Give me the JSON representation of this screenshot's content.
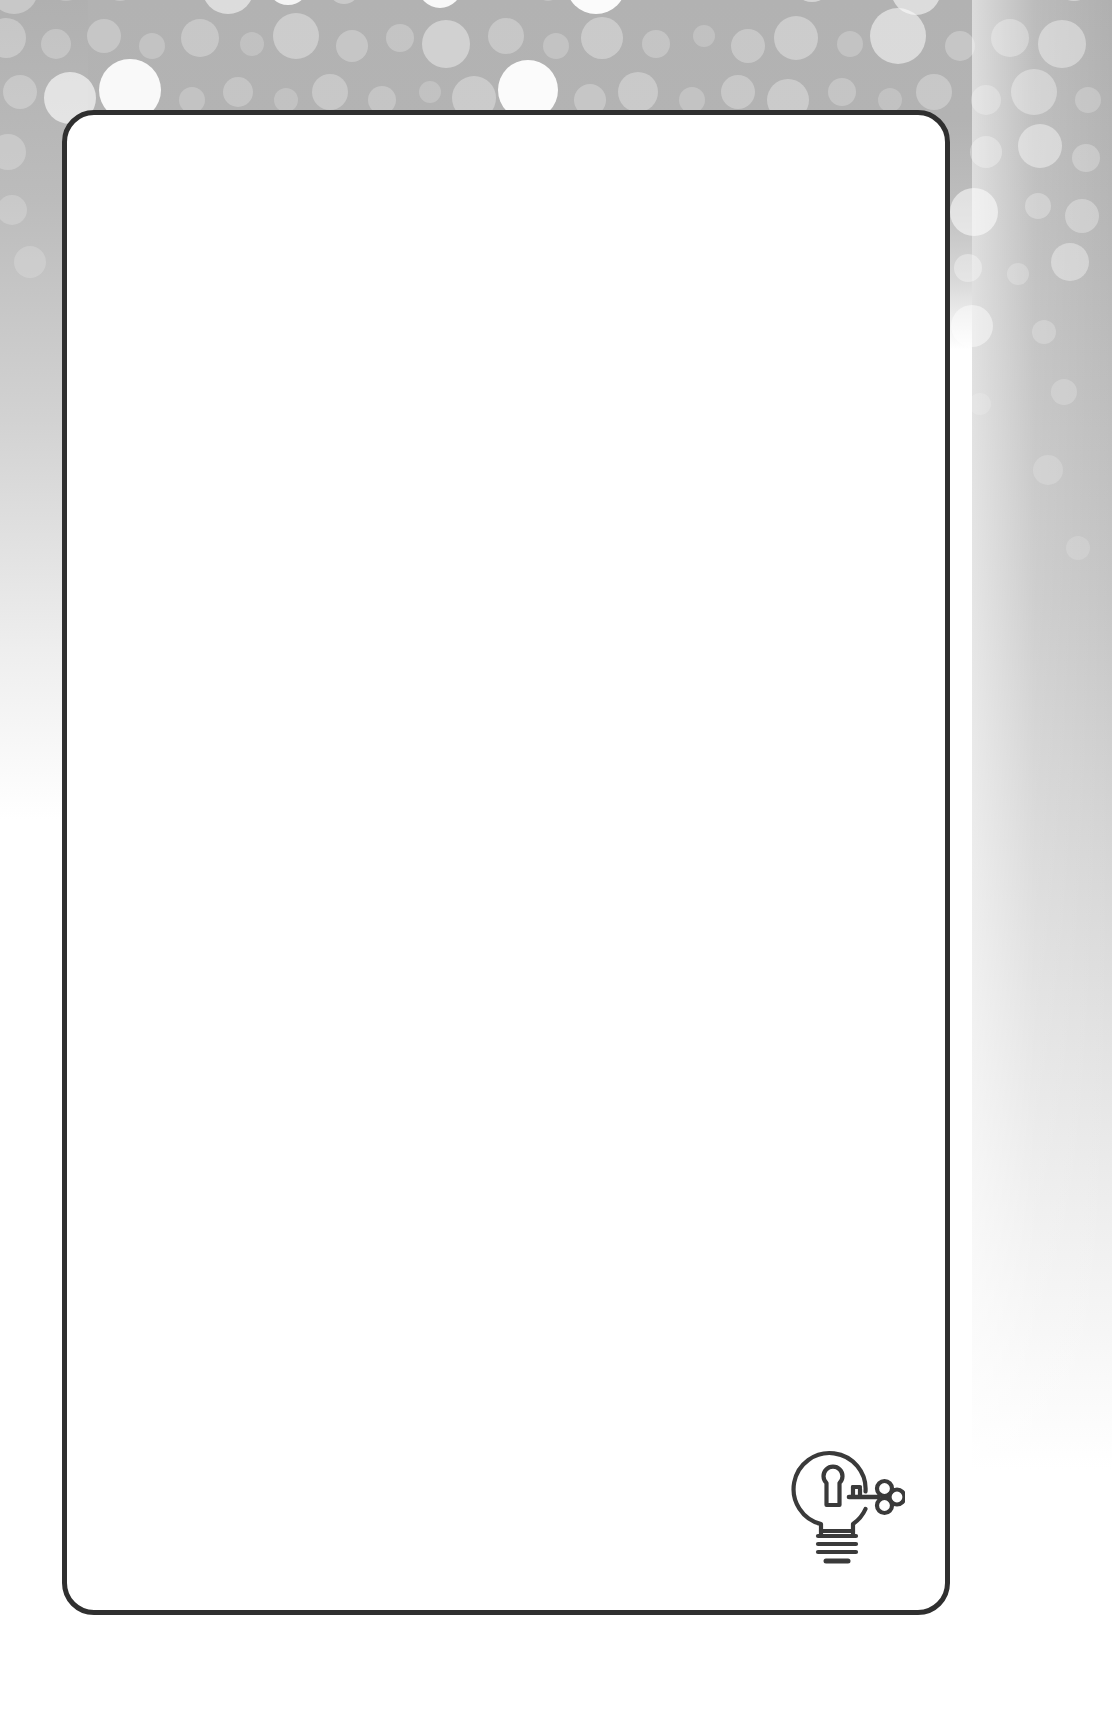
{
  "document": {
    "kind": "blank-certificate-template",
    "title": "",
    "body_text": "",
    "background_style": "bokeh-dots-grey-gradient"
  },
  "card": {
    "border_color": "#2f2f2f",
    "background_color": "#ffffff",
    "border_radius_px": 32,
    "border_width_px": 5,
    "content": ""
  },
  "logo": {
    "name": "lightbulb-keyhole-key-icon",
    "description": "Light bulb outline containing a keyhole with a key inserted from the right",
    "stroke_color": "#3a3a3a",
    "caption": ""
  },
  "background": {
    "band_color_top": "#b2b2b2",
    "band_color_left": "#b0b0b0",
    "band_color_right": "#b0b0b0",
    "dot_color": "#ffffff",
    "page_color": "#ffffff"
  },
  "decor_dots": [
    {
      "x": 14,
      "y": -10,
      "r": 24,
      "o": 0.3
    },
    {
      "x": 66,
      "y": -18,
      "r": 19,
      "o": 0.22
    },
    {
      "x": 120,
      "y": -14,
      "r": 15,
      "o": 0.25
    },
    {
      "x": 176,
      "y": -20,
      "r": 12,
      "o": 0.2
    },
    {
      "x": 228,
      "y": -12,
      "r": 26,
      "o": 0.55
    },
    {
      "x": 288,
      "y": -16,
      "r": 21,
      "o": 0.85
    },
    {
      "x": 344,
      "y": -12,
      "r": 16,
      "o": 0.3
    },
    {
      "x": 392,
      "y": -18,
      "r": 13,
      "o": 0.25
    },
    {
      "x": 440,
      "y": -14,
      "r": 22,
      "o": 0.9
    },
    {
      "x": 500,
      "y": -20,
      "r": 14,
      "o": 0.3
    },
    {
      "x": 548,
      "y": -10,
      "r": 11,
      "o": 0.22
    },
    {
      "x": 596,
      "y": -16,
      "r": 30,
      "o": 0.95
    },
    {
      "x": 660,
      "y": -14,
      "r": 13,
      "o": 0.25
    },
    {
      "x": 710,
      "y": -20,
      "r": 16,
      "o": 0.3
    },
    {
      "x": 764,
      "y": -12,
      "r": 12,
      "o": 0.22
    },
    {
      "x": 812,
      "y": -18,
      "r": 20,
      "o": 0.45
    },
    {
      "x": 866,
      "y": -14,
      "r": 14,
      "o": 0.25
    },
    {
      "x": 916,
      "y": -10,
      "r": 25,
      "o": 0.55
    },
    {
      "x": 974,
      "y": -18,
      "r": 18,
      "o": 0.3
    },
    {
      "x": 1026,
      "y": -14,
      "r": 13,
      "o": 0.25
    },
    {
      "x": 1074,
      "y": -20,
      "r": 21,
      "o": 0.4
    },
    {
      "x": 6,
      "y": 38,
      "r": 20,
      "o": 0.28
    },
    {
      "x": 56,
      "y": 44,
      "r": 15,
      "o": 0.24
    },
    {
      "x": 104,
      "y": 36,
      "r": 17,
      "o": 0.26
    },
    {
      "x": 152,
      "y": 46,
      "r": 13,
      "o": 0.22
    },
    {
      "x": 200,
      "y": 38,
      "r": 19,
      "o": 0.28
    },
    {
      "x": 252,
      "y": 44,
      "r": 12,
      "o": 0.2
    },
    {
      "x": 296,
      "y": 36,
      "r": 23,
      "o": 0.34
    },
    {
      "x": 352,
      "y": 46,
      "r": 16,
      "o": 0.26
    },
    {
      "x": 400,
      "y": 38,
      "r": 14,
      "o": 0.24
    },
    {
      "x": 446,
      "y": 44,
      "r": 24,
      "o": 0.4
    },
    {
      "x": 506,
      "y": 36,
      "r": 18,
      "o": 0.28
    },
    {
      "x": 556,
      "y": 46,
      "r": 13,
      "o": 0.22
    },
    {
      "x": 602,
      "y": 38,
      "r": 21,
      "o": 0.32
    },
    {
      "x": 656,
      "y": 44,
      "r": 14,
      "o": 0.24
    },
    {
      "x": 704,
      "y": 36,
      "r": 11,
      "o": 0.2
    },
    {
      "x": 748,
      "y": 46,
      "r": 17,
      "o": 0.28
    },
    {
      "x": 796,
      "y": 38,
      "r": 22,
      "o": 0.34
    },
    {
      "x": 850,
      "y": 44,
      "r": 13,
      "o": 0.22
    },
    {
      "x": 898,
      "y": 36,
      "r": 28,
      "o": 0.52
    },
    {
      "x": 960,
      "y": 46,
      "r": 15,
      "o": 0.26
    },
    {
      "x": 1010,
      "y": 38,
      "r": 19,
      "o": 0.3
    },
    {
      "x": 1062,
      "y": 44,
      "r": 24,
      "o": 0.38
    },
    {
      "x": 20,
      "y": 92,
      "r": 17,
      "o": 0.26
    },
    {
      "x": 70,
      "y": 98,
      "r": 26,
      "o": 0.62
    },
    {
      "x": 130,
      "y": 90,
      "r": 31,
      "o": 0.92
    },
    {
      "x": 192,
      "y": 100,
      "r": 13,
      "o": 0.22
    },
    {
      "x": 238,
      "y": 92,
      "r": 15,
      "o": 0.24
    },
    {
      "x": 286,
      "y": 100,
      "r": 12,
      "o": 0.2
    },
    {
      "x": 330,
      "y": 92,
      "r": 18,
      "o": 0.28
    },
    {
      "x": 382,
      "y": 100,
      "r": 14,
      "o": 0.24
    },
    {
      "x": 430,
      "y": 92,
      "r": 11,
      "o": 0.2
    },
    {
      "x": 474,
      "y": 98,
      "r": 22,
      "o": 0.32
    },
    {
      "x": 528,
      "y": 90,
      "r": 30,
      "o": 0.95
    },
    {
      "x": 590,
      "y": 100,
      "r": 16,
      "o": 0.26
    },
    {
      "x": 638,
      "y": 92,
      "r": 20,
      "o": 0.3
    },
    {
      "x": 692,
      "y": 100,
      "r": 13,
      "o": 0.22
    },
    {
      "x": 738,
      "y": 92,
      "r": 17,
      "o": 0.28
    },
    {
      "x": 788,
      "y": 100,
      "r": 21,
      "o": 0.32
    },
    {
      "x": 842,
      "y": 92,
      "r": 14,
      "o": 0.24
    },
    {
      "x": 890,
      "y": 100,
      "r": 12,
      "o": 0.2
    },
    {
      "x": 934,
      "y": 92,
      "r": 18,
      "o": 0.28
    },
    {
      "x": 986,
      "y": 100,
      "r": 15,
      "o": 0.26
    },
    {
      "x": 1034,
      "y": 92,
      "r": 23,
      "o": 0.34
    },
    {
      "x": 1088,
      "y": 100,
      "r": 13,
      "o": 0.22
    },
    {
      "x": 8,
      "y": 152,
      "r": 18,
      "o": 0.24
    },
    {
      "x": 986,
      "y": 152,
      "r": 16,
      "o": 0.3
    },
    {
      "x": 1040,
      "y": 146,
      "r": 22,
      "o": 0.42
    },
    {
      "x": 1086,
      "y": 158,
      "r": 14,
      "o": 0.26
    },
    {
      "x": 12,
      "y": 210,
      "r": 15,
      "o": 0.2
    },
    {
      "x": 974,
      "y": 212,
      "r": 24,
      "o": 0.55
    },
    {
      "x": 1038,
      "y": 206,
      "r": 13,
      "o": 0.28
    },
    {
      "x": 1082,
      "y": 216,
      "r": 17,
      "o": 0.3
    },
    {
      "x": 968,
      "y": 268,
      "r": 14,
      "o": 0.34
    },
    {
      "x": 1018,
      "y": 274,
      "r": 11,
      "o": 0.22
    },
    {
      "x": 1070,
      "y": 262,
      "r": 19,
      "o": 0.36
    },
    {
      "x": 972,
      "y": 326,
      "r": 21,
      "o": 0.46
    },
    {
      "x": 1044,
      "y": 332,
      "r": 12,
      "o": 0.22
    },
    {
      "x": 30,
      "y": 262,
      "r": 16,
      "o": 0.18
    },
    {
      "x": 1064,
      "y": 392,
      "r": 13,
      "o": 0.2
    },
    {
      "x": 980,
      "y": 404,
      "r": 11,
      "o": 0.16
    },
    {
      "x": 1048,
      "y": 470,
      "r": 15,
      "o": 0.18
    },
    {
      "x": 1078,
      "y": 548,
      "r": 12,
      "o": 0.15
    }
  ]
}
